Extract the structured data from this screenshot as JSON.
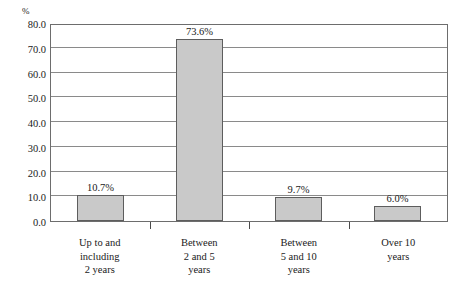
{
  "chart_data": {
    "type": "bar",
    "title": "",
    "subtitle": "",
    "xlabel": "",
    "ylabel": "%",
    "ylim": [
      0,
      80
    ],
    "ytick_step": 10,
    "grid": true,
    "legend": false,
    "categories": [
      "Up to and including 2 years",
      "Between 2 and 5 years",
      "Between 5 and 10 years",
      "Over 10 years"
    ],
    "category_lines": [
      [
        "Up to and",
        "including",
        "2 years"
      ],
      [
        "Between",
        "2 and 5",
        "years"
      ],
      [
        "Between",
        "5 and 10",
        "years"
      ],
      [
        "Over 10",
        "years"
      ]
    ],
    "values": [
      10.7,
      73.6,
      9.7,
      6.0
    ],
    "value_labels": [
      "10.7%",
      "73.6%",
      "9.7%",
      "6.0%"
    ],
    "ytick_labels": [
      "80.0",
      "70.0",
      "60.0",
      "50.0",
      "40.0",
      "30.0",
      "20.0",
      "10.0",
      "0.0"
    ],
    "ytick_values": [
      80,
      70,
      60,
      50,
      40,
      30,
      20,
      10,
      0
    ],
    "colors": {
      "bar_fill": "#c9c9c9",
      "bar_border": "#5d5d5d",
      "gridline": "#8a8a8a",
      "plot_border": "#6d6d6d",
      "text": "#1a1a1a",
      "background": "#ffffff"
    }
  },
  "axis": {
    "unit_label": "%"
  }
}
